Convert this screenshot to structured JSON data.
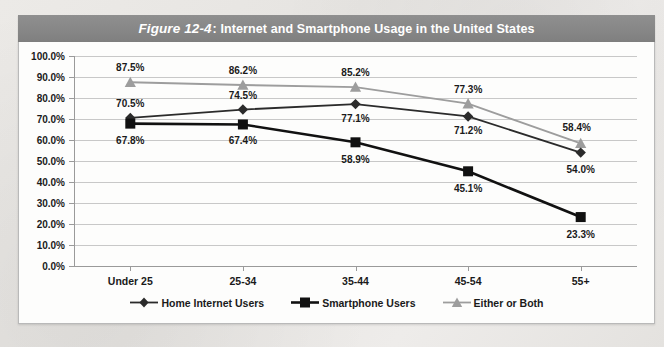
{
  "figure": {
    "number_label": "Figure 12-4",
    "title": ": Internet and Smartphone Usage in the United States"
  },
  "chart_data": {
    "type": "line",
    "title": "Figure 12-4: Internet and Smartphone Usage in the United States",
    "xlabel": "",
    "ylabel": "",
    "categories": [
      "Under 25",
      "25-34",
      "35-44",
      "45-54",
      "55+"
    ],
    "ylim": [
      0,
      100
    ],
    "ytick_labels": [
      "100.0%",
      "90.0%",
      "80.0%",
      "70.0%",
      "60.0%",
      "50.0%",
      "40.0%",
      "30.0%",
      "20.0%",
      "10.0%",
      "0.0%"
    ],
    "ytick_values": [
      100,
      90,
      80,
      70,
      60,
      50,
      40,
      30,
      20,
      10,
      0
    ],
    "grid": true,
    "legend_position": "bottom",
    "series": [
      {
        "name": "Home Internet Users",
        "marker": "diamond",
        "color": "#2b2b2b",
        "values": [
          70.5,
          74.5,
          77.1,
          71.2,
          54.0
        ],
        "labels": [
          "70.5%",
          "74.5%",
          "77.1%",
          "71.2%",
          "54.0%"
        ]
      },
      {
        "name": "Smartphone Users",
        "marker": "square",
        "color": "#111111",
        "values": [
          67.8,
          67.4,
          58.9,
          45.1,
          23.3
        ],
        "labels": [
          "67.8%",
          "67.4%",
          "58.9%",
          "45.1%",
          "23.3%"
        ]
      },
      {
        "name": "Either or Both",
        "marker": "triangle",
        "color": "#9d9d9d",
        "values": [
          87.5,
          86.2,
          85.2,
          77.3,
          58.4
        ],
        "labels": [
          "87.5%",
          "86.2%",
          "85.2%",
          "77.3%",
          "58.4%"
        ]
      }
    ],
    "label_offsets": [
      [
        [
          0,
          -15
        ],
        [
          0,
          -15
        ],
        [
          0,
          14
        ],
        [
          0,
          14
        ],
        [
          0,
          16
        ]
      ],
      [
        [
          0,
          16
        ],
        [
          0,
          16
        ],
        [
          0,
          17
        ],
        [
          0,
          17
        ],
        [
          0,
          17
        ]
      ],
      [
        [
          0,
          -15
        ],
        [
          0,
          -15
        ],
        [
          0,
          -15
        ],
        [
          0,
          -15
        ],
        [
          -4,
          -16
        ]
      ]
    ]
  },
  "colors": {
    "title_bar": "#878787",
    "frame": "#b9b9b9",
    "grid": "#c8c8c8",
    "axis": "#9a9a9a"
  }
}
